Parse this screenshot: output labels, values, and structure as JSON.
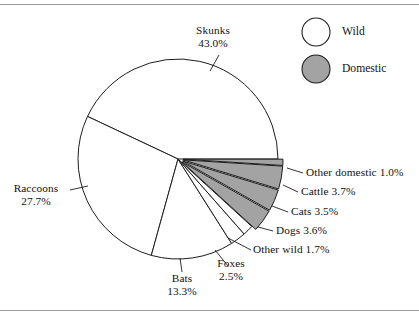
{
  "figure": {
    "background_color": "#ffffff",
    "rule_color": "#9b9b9b",
    "outline_color": "#1d1d1d"
  },
  "legend": {
    "position": "top-right",
    "items": [
      {
        "label": "Wild",
        "swatch": "wild-swatch-circle",
        "color": "#ffffff"
      },
      {
        "label": "Domestic",
        "swatch": "domestic-swatch-circle",
        "color": "#a3a3a3"
      }
    ]
  },
  "labels": {
    "skunks": {
      "name": "Skunks",
      "value": "43.0%"
    },
    "raccoons": {
      "name": "Raccoons",
      "value": "27.7%"
    },
    "bats": {
      "name": "Bats",
      "value": "13.3%"
    },
    "foxes": {
      "name": "Foxes",
      "value": "2.5%"
    },
    "other_wild": {
      "text": "Other wild 1.7%"
    },
    "dogs": {
      "text": "Dogs 3.6%"
    },
    "cats": {
      "text": "Cats 3.5%"
    },
    "cattle": {
      "text": "Cattle 3.7%"
    },
    "other_domestic": {
      "text": "Other domestic 1.0%"
    }
  },
  "chart_data": {
    "type": "pie",
    "title": "",
    "subtitle": "",
    "xlabel": "",
    "ylabel": "",
    "grid": false,
    "legend_position": "top-right",
    "units": "percent",
    "total": 100.0,
    "start_angle_deg": 0,
    "direction": "counterclockwise",
    "categories": [
      "Skunks",
      "Raccoons",
      "Bats",
      "Foxes",
      "Other wild",
      "Dogs",
      "Cats",
      "Cattle",
      "Other domestic"
    ],
    "values": [
      43.0,
      27.7,
      13.3,
      2.5,
      1.7,
      3.6,
      3.5,
      3.7,
      1.0
    ],
    "slices": [
      {
        "label": "Skunks",
        "value": 43.0,
        "group": "Wild",
        "color": "#ffffff",
        "exploded": false
      },
      {
        "label": "Raccoons",
        "value": 27.7,
        "group": "Wild",
        "color": "#ffffff",
        "exploded": false
      },
      {
        "label": "Bats",
        "value": 13.3,
        "group": "Wild",
        "color": "#ffffff",
        "exploded": false
      },
      {
        "label": "Foxes",
        "value": 2.5,
        "group": "Wild",
        "color": "#ffffff",
        "exploded": false
      },
      {
        "label": "Other wild",
        "value": 1.7,
        "group": "Wild",
        "color": "#ffffff",
        "exploded": false
      },
      {
        "label": "Dogs",
        "value": 3.6,
        "group": "Domestic",
        "color": "#a3a3a3",
        "exploded": true
      },
      {
        "label": "Cats",
        "value": 3.5,
        "group": "Domestic",
        "color": "#a3a3a3",
        "exploded": true
      },
      {
        "label": "Cattle",
        "value": 3.7,
        "group": "Domestic",
        "color": "#a3a3a3",
        "exploded": true
      },
      {
        "label": "Other domestic",
        "value": 1.0,
        "group": "Domestic",
        "color": "#a3a3a3",
        "exploded": true
      }
    ],
    "series": [
      {
        "name": "Rabies cases by animal",
        "values": [
          43.0,
          27.7,
          13.3,
          2.5,
          1.7,
          3.6,
          3.5,
          3.7,
          1.0
        ]
      }
    ],
    "groups": [
      {
        "name": "Wild",
        "color": "#ffffff",
        "total": 88.2
      },
      {
        "name": "Domestic",
        "color": "#a3a3a3",
        "total": 11.8
      }
    ]
  }
}
